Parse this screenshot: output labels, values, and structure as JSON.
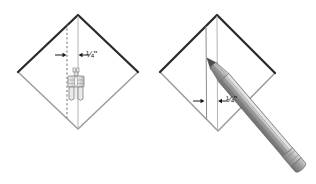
{
  "figure": {
    "background_color": "#ffffff",
    "ink_dark": "#2b2b2b",
    "ink_mid": "#8a8a8a",
    "ink_light": "#b8b8b8",
    "pencil_body": "#9a9a9a",
    "pencil_shadow": "#6e6e6e",
    "pencil_highlight": "#d6d6d6",
    "ferrule_color": "#a8a8a8",
    "eraser_color": "#8e8e8e"
  },
  "panels": [
    {
      "id": "left-panel",
      "name": "presser-foot-panel",
      "caption": "",
      "shape": "folded-fabric-diamond",
      "diamond": {
        "top": [
          78,
          15
        ],
        "right": [
          138,
          72
        ],
        "bottom": [
          78,
          129
        ],
        "left": [
          18,
          72
        ]
      },
      "guides": [
        {
          "type": "dashed-vertical",
          "label": "stitch-guide-line",
          "x": 67,
          "y1": 24,
          "y2": 118
        },
        {
          "type": "solid-vertical",
          "label": "center-fold-line",
          "x": 78,
          "y1": 16,
          "y2": 128
        }
      ],
      "measurement": {
        "label": "¼\"",
        "whole": "",
        "numerator": "1",
        "denominator": "4",
        "unit": "\"",
        "arrow_left_x": 59,
        "arrow_right_x": 86,
        "arrow_y": 55
      },
      "tool": {
        "name": "presser-foot-icon",
        "label": "sewing machine presser foot",
        "x": 62,
        "y": 70,
        "width": 30,
        "height": 42
      }
    },
    {
      "id": "right-panel",
      "name": "pencil-marking-panel",
      "caption": "",
      "shape": "folded-fabric-diamond",
      "diamond": {
        "top": [
          217,
          15
        ],
        "right": [
          275,
          73
        ],
        "bottom": [
          218,
          131
        ],
        "left": [
          160,
          72
        ]
      },
      "guides": [
        {
          "type": "solid-vertical",
          "label": "drawn-quarter-inch-line",
          "x": 206,
          "y1": 26,
          "y2": 120
        },
        {
          "type": "solid-vertical",
          "label": "center-fold-line",
          "x": 217,
          "y1": 16,
          "y2": 130
        }
      ],
      "measurement": {
        "label": "¼\"",
        "whole": "",
        "numerator": "1",
        "denominator": "4",
        "unit": "\"",
        "arrow_left_x": 196,
        "arrow_right_x": 226,
        "arrow_y": 101
      },
      "tool": {
        "name": "pencil-icon",
        "label": "marking pencil",
        "tip": [
          207,
          58
        ],
        "end": [
          308,
          176
        ],
        "has_eraser": true,
        "has_ferrule": true
      }
    }
  ]
}
